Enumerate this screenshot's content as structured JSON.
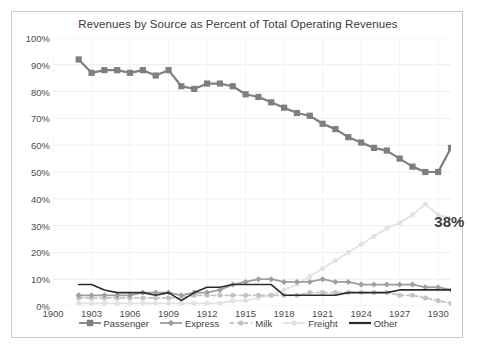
{
  "chart_data": {
    "type": "line",
    "title": "Revenues by Source as Percent of Total Operating Revenues",
    "xlabel": "",
    "ylabel": "",
    "ylim": [
      0,
      100
    ],
    "xlim": [
      1900,
      1931
    ],
    "grid": true,
    "legend_position": "bottom",
    "y_ticks": [
      "100%",
      "90%",
      "80%",
      "70%",
      "60%",
      "50%",
      "40%",
      "30%",
      "20%",
      "10%",
      "0%"
    ],
    "y_tick_values": [
      100,
      90,
      80,
      70,
      60,
      50,
      40,
      30,
      20,
      10,
      0
    ],
    "x_ticks": [
      "1900",
      "1903",
      "1906",
      "1909",
      "1912",
      "1915",
      "1918",
      "1921",
      "1924",
      "1927",
      "1930"
    ],
    "x_tick_values": [
      1900,
      1903,
      1906,
      1909,
      1912,
      1915,
      1918,
      1921,
      1924,
      1927,
      1930
    ],
    "x": [
      1902,
      1903,
      1904,
      1905,
      1906,
      1907,
      1908,
      1909,
      1910,
      1911,
      1912,
      1913,
      1914,
      1915,
      1916,
      1917,
      1918,
      1919,
      1920,
      1921,
      1922,
      1923,
      1924,
      1925,
      1926,
      1927,
      1928,
      1929,
      1930,
      1931
    ],
    "annotations": [
      {
        "text": "38%",
        "x": 1930,
        "y": 32,
        "series": "Freight"
      }
    ],
    "series": [
      {
        "name": "Passenger",
        "color": "#7f7f7f",
        "marker": "square",
        "line_style": "solid",
        "values": [
          92,
          87,
          88,
          88,
          87,
          88,
          86,
          88,
          82,
          81,
          83,
          83,
          82,
          79,
          78,
          76,
          74,
          72,
          71,
          68,
          66,
          63,
          61,
          59,
          58,
          55,
          52,
          50,
          50,
          59
        ]
      },
      {
        "name": "Express",
        "color": "#9e9e9e",
        "marker": "diamond",
        "line_style": "solid",
        "values": [
          4,
          4,
          4,
          4,
          4,
          5,
          5,
          5,
          4,
          5,
          5,
          6,
          8,
          9,
          10,
          10,
          9,
          9,
          9,
          10,
          9,
          9,
          8,
          8,
          8,
          8,
          8,
          7,
          7,
          6
        ]
      },
      {
        "name": "Milk",
        "color": "#c4c4c4",
        "marker": "circle",
        "line_style": "dashed",
        "values": [
          3,
          3,
          3,
          3,
          3,
          3,
          3,
          3,
          3,
          4,
          4,
          4,
          4,
          4,
          4,
          4,
          4,
          4,
          5,
          5,
          5,
          5,
          5,
          5,
          5,
          4,
          4,
          3,
          2,
          1
        ]
      },
      {
        "name": "Freight",
        "color": "#e2e2e2",
        "marker": "circle",
        "line_style": "solid",
        "values": [
          1,
          1,
          1,
          1,
          1,
          1,
          1,
          1,
          1,
          1,
          1,
          1,
          2,
          2,
          3,
          4,
          6,
          8,
          11,
          14,
          17,
          20,
          23,
          26,
          29,
          31,
          34,
          38,
          34,
          33
        ]
      },
      {
        "name": "Other",
        "color": "#2b2b2b",
        "marker": "none",
        "line_style": "solid",
        "values": [
          8,
          8,
          6,
          5,
          5,
          5,
          4,
          5,
          2,
          5,
          7,
          7,
          8,
          8,
          8,
          8,
          4,
          4,
          4,
          4,
          4,
          5,
          5,
          5,
          5,
          6,
          6,
          6,
          6,
          6
        ]
      }
    ]
  },
  "legend": {
    "items": [
      {
        "label": "Passenger"
      },
      {
        "label": "Express"
      },
      {
        "label": "Milk"
      },
      {
        "label": "Freight"
      },
      {
        "label": "Other"
      }
    ]
  },
  "caption": {
    "text": ""
  }
}
